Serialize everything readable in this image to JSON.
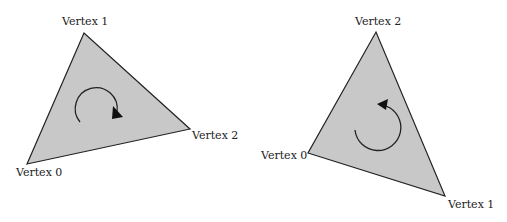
{
  "diagram": {
    "fill_color": "#c8c8c8",
    "stroke_color": "#222222",
    "triangles": [
      {
        "name": "clockwise-triangle",
        "winding": "clockwise",
        "vertices": [
          {
            "label": "Vertex 0",
            "x": 27,
            "y": 164
          },
          {
            "label": "Vertex 1",
            "x": 84,
            "y": 33
          },
          {
            "label": "Vertex 2",
            "x": 190,
            "y": 129
          }
        ]
      },
      {
        "name": "counter-clockwise-triangle",
        "winding": "counter-clockwise",
        "vertices": [
          {
            "label": "Vertex 0",
            "x": 308,
            "y": 153
          },
          {
            "label": "Vertex 1",
            "x": 445,
            "y": 196
          },
          {
            "label": "Vertex 2",
            "x": 376,
            "y": 32
          }
        ]
      }
    ]
  }
}
